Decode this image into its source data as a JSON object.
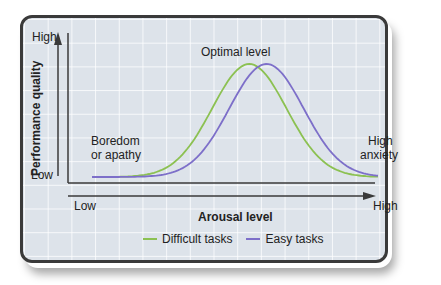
{
  "chart_data": {
    "type": "line",
    "title": "",
    "xlabel": "Arousal level",
    "ylabel": "Performance quality",
    "x_ticks": [
      "Low",
      "High"
    ],
    "y_ticks": [
      "Low",
      "High"
    ],
    "annotations": [
      "Optimal level",
      "Boredom or apathy",
      "High anxiety"
    ],
    "legend_position": "bottom",
    "grid": true,
    "x": [
      0,
      0.1,
      0.2,
      0.3,
      0.4,
      0.5,
      0.55,
      0.6,
      0.7,
      0.8,
      0.9,
      1.0
    ],
    "series": [
      {
        "name": "Difficult tasks",
        "color": "#8cc152",
        "peak_x": 0.55,
        "values": [
          0.02,
          0.03,
          0.08,
          0.3,
          0.72,
          0.98,
          1.0,
          0.95,
          0.6,
          0.22,
          0.05,
          0.02
        ]
      },
      {
        "name": "Easy tasks",
        "color": "#7d6fc9",
        "peak_x": 0.61,
        "values": [
          0.01,
          0.02,
          0.04,
          0.15,
          0.45,
          0.85,
          0.96,
          1.0,
          0.8,
          0.4,
          0.1,
          0.03
        ]
      }
    ],
    "ylim": [
      0,
      1
    ],
    "xlim": [
      0,
      1
    ]
  },
  "labels": {
    "y_high": "High",
    "y_low": "Low",
    "x_low": "Low",
    "x_high": "High",
    "ylabel": "Performance quality",
    "xlabel": "Arousal level",
    "optimal": "Optimal level",
    "boredom_1": "Boredom",
    "boredom_2": "or apathy",
    "anxiety_1": "High",
    "anxiety_2": "anxiety"
  },
  "legend": [
    {
      "label": "Difficult tasks",
      "color": "#8cc152"
    },
    {
      "label": "Easy tasks",
      "color": "#7d6fc9"
    }
  ]
}
